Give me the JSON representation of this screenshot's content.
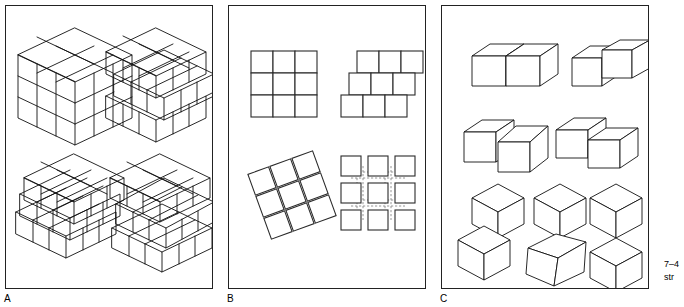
{
  "figure": {
    "caption_line1": "7–4",
    "caption_line2": "str",
    "panels": [
      {
        "id": "A",
        "label": "A",
        "title": "three-dimensional cube assemblies",
        "items": [
          {
            "name": "cube-aligned-3x3x3",
            "description": "3 by 3 by 3 cube with all unit cubes flush aligned",
            "position": "top-left"
          },
          {
            "name": "cube-offset-layers-right",
            "description": "3 by 3 by 3 cube with horizontally offset layers",
            "position": "top-right"
          },
          {
            "name": "cube-staircase-offset",
            "description": "3 by 3 by 3 cube with layers stepped toward viewer",
            "position": "bottom-left"
          },
          {
            "name": "cube-split-layers",
            "description": "3 by 3 by 3 cube with separated and rotated layers",
            "position": "bottom-right"
          }
        ]
      },
      {
        "id": "B",
        "label": "B",
        "title": "two-dimensional square arrays",
        "items": [
          {
            "name": "grid-aligned-3x3",
            "description": "3 by 3 grid of squares, edges flush",
            "position": "top-left"
          },
          {
            "name": "grid-brick-offset",
            "description": "3 rows of 3 squares, each row offset like brickwork",
            "position": "top-right"
          },
          {
            "name": "grid-rotated-tiles",
            "description": "3 by 3 array of individually rotated squares",
            "position": "bottom-left"
          },
          {
            "name": "grid-separated-dashed",
            "description": "3 by 3 array of separated squares with dashed alignment guides",
            "position": "bottom-right"
          }
        ]
      },
      {
        "id": "C",
        "label": "C",
        "title": "cube pair relations",
        "items": [
          {
            "name": "pair-side-by-side-flush",
            "description": "two cubes joined face to face, aligned",
            "position": "row1-left"
          },
          {
            "name": "pair-side-by-side-raised",
            "description": "two cubes side by side, right cube raised",
            "position": "row1-right"
          },
          {
            "name": "pair-overlap-front",
            "description": "two cubes with the right cube pulled forward",
            "position": "row2-left"
          },
          {
            "name": "pair-offset-depth",
            "description": "two cubes offset in depth, touching at a corner",
            "position": "row2-right"
          },
          {
            "name": "pair-stacked-offset",
            "description": "cube above a cube, lower cube shifted left",
            "position": "row3-left"
          },
          {
            "name": "pair-stacked-rotated",
            "description": "cube above a rotated lower cube",
            "position": "row3-center"
          },
          {
            "name": "pair-stacked-point-contact",
            "description": "two cubes touching at a single vertex",
            "position": "row3-right"
          }
        ]
      }
    ]
  },
  "colors": {
    "ink": "#111111",
    "panel_border": "#222222",
    "dashed_guide": "#8a8a8a",
    "background": "#ffffff"
  }
}
